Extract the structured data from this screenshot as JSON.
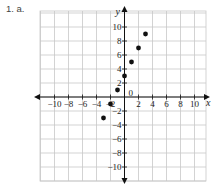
{
  "problem_label": "1.  a.",
  "chart_data": {
    "type": "scatter",
    "title": "",
    "xlabel": "x",
    "ylabel": "y",
    "xlim": [
      -11,
      11
    ],
    "ylim": [
      -11,
      11
    ],
    "grid": true,
    "x_ticks": [
      -10,
      -8,
      -6,
      -4,
      -2,
      0,
      2,
      4,
      6,
      8,
      10
    ],
    "y_ticks": [
      -10,
      -8,
      -6,
      -4,
      -2,
      2,
      4,
      6,
      8,
      10
    ],
    "x_tick_labels": [
      "−10",
      "−8",
      "−6",
      "−4",
      "−2",
      "0",
      "2",
      "4",
      "6",
      "8",
      "10"
    ],
    "y_tick_labels": [
      "−10",
      "−8",
      "−6",
      "−4",
      "−2",
      "2",
      "4",
      "6",
      "8",
      "10"
    ],
    "points": [
      {
        "x": -3,
        "y": -3
      },
      {
        "x": -2,
        "y": -1
      },
      {
        "x": -1,
        "y": 1
      },
      {
        "x": 0,
        "y": 3
      },
      {
        "x": 1,
        "y": 5
      },
      {
        "x": 2,
        "y": 7
      },
      {
        "x": 3,
        "y": 9
      }
    ],
    "colors": {
      "grid": "#c8c8c8",
      "axis": "#111111",
      "point": "#111111"
    }
  }
}
